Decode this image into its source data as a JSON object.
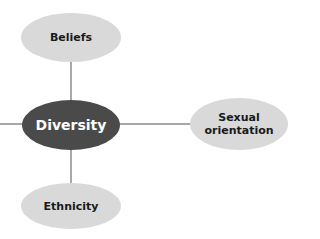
{
  "diagram": {
    "type": "mind-map",
    "center": {
      "label": "Diversity",
      "fill": "#4a4a4a",
      "text_color": "#ffffff"
    },
    "branches": [
      {
        "id": "beliefs",
        "label": "Beliefs",
        "position": "top"
      },
      {
        "id": "sexual-orientation",
        "label": "Sexual orientation",
        "line1": "Sexual",
        "line2": "orientation",
        "position": "right"
      },
      {
        "id": "ethnicity",
        "label": "Ethnicity",
        "position": "bottom"
      },
      {
        "id": "offscreen-left",
        "label": "",
        "position": "left"
      }
    ],
    "leaf_fill": "#d9d9d9",
    "connector_color": "#a8a8a8"
  }
}
